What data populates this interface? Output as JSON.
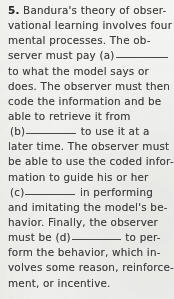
{
  "document": {
    "type": "textbook-fill-in-the-blank-question",
    "question_number": "5.",
    "full_text": "5. Bandura's theory of observational learning involves four mental processes. The observer must pay (a)__________ to what the model says or does. The observer must then code the information and be able to retrieve it from (b)__________ to use it at a later time. The observer must be able to use the coded information to guide his or her (c)__________ in performing and imitating the model's behavior. Finally, the observer must be (d)__________ to perform the behavior, which involves some reason, reinforcement, or incentive.",
    "blank_labels": [
      "(a)",
      "(b)",
      "(c)",
      "(d)"
    ],
    "lines": [
      {
        "id": "line-1",
        "num": "5.",
        "text": " Bandura's theory of obser-"
      },
      {
        "id": "line-2",
        "text": "vational learning involves four"
      },
      {
        "id": "line-3",
        "text": "mental processes. The ob-"
      },
      {
        "id": "line-4",
        "text": "server must pay (a)"
      },
      {
        "id": "line-5",
        "text": "to what the model says or"
      },
      {
        "id": "line-6",
        "text": "does. The observer must then"
      },
      {
        "id": "line-7",
        "text": "code the information and be"
      },
      {
        "id": "line-8",
        "text": "able to retrieve it from"
      },
      {
        "id": "line-9",
        "pre": "(b)",
        "post": " to use it at a"
      },
      {
        "id": "line-10",
        "text": "later time. The observer must"
      },
      {
        "id": "line-11",
        "text": "be able to use the coded infor-"
      },
      {
        "id": "line-12",
        "text": "mation to guide his or her"
      },
      {
        "id": "line-13",
        "pre": "(c)",
        "post": " in performing"
      },
      {
        "id": "line-14",
        "text": "and imitating the model's be-"
      },
      {
        "id": "line-15",
        "text": "havior. Finally, the observer"
      },
      {
        "id": "line-16",
        "pre": "must be (d)",
        "post": " to per-"
      },
      {
        "id": "line-17",
        "text": "form the behavior, which in-"
      },
      {
        "id": "line-18",
        "text": "volves some reason, reinforce-"
      },
      {
        "id": "line-19",
        "text": "ment, or incentive."
      }
    ]
  },
  "colors": {
    "page_background": "#f1f1ef",
    "text": "#3b3b3b",
    "rule": "#4a4a4a"
  }
}
